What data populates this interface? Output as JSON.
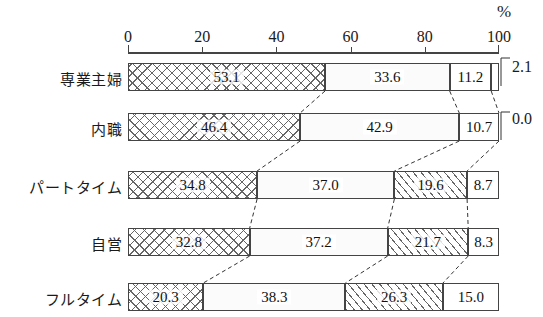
{
  "chart_data": {
    "type": "bar",
    "orientation": "horizontal",
    "stacked": true,
    "stack_mode": "percent",
    "title": "",
    "xlabel": "%",
    "ylabel": "",
    "xlim": [
      0,
      100
    ],
    "xticks": [
      0,
      20,
      40,
      60,
      80,
      100
    ],
    "xtick_labels": [
      "0",
      "20",
      "40",
      "60",
      "80",
      "100"
    ],
    "grid": false,
    "legend": "none",
    "categories": [
      "専業主婦",
      "内職",
      "パートタイム",
      "自営",
      "フルタイム"
    ],
    "series": [
      {
        "name": "series-1",
        "pattern": "cross-hatch",
        "values": [
          53.1,
          46.4,
          34.8,
          32.8,
          20.3
        ]
      },
      {
        "name": "series-2",
        "pattern": "dotted",
        "values": [
          33.6,
          42.9,
          37.0,
          37.2,
          38.3
        ]
      },
      {
        "name": "series-3",
        "pattern": "diagonal-hatch",
        "values": [
          0.0,
          0.0,
          19.6,
          21.7,
          26.3
        ]
      },
      {
        "name": "series-4",
        "pattern": "plain",
        "values": [
          11.2,
          10.7,
          8.7,
          8.3,
          15.0
        ]
      },
      {
        "name": "series-5",
        "pattern": "plain",
        "values": [
          2.1,
          0.0,
          0.0,
          0.0,
          0.0
        ]
      }
    ],
    "annotations": [
      {
        "text": "2.1",
        "row": "専業主婦",
        "position": "right-outside"
      },
      {
        "text": "0.0",
        "row": "内職",
        "position": "right-outside"
      }
    ],
    "rows": [
      {
        "label": "専業主婦",
        "segments": [
          {
            "value": "53.1",
            "size": 53.1,
            "pattern": "cross"
          },
          {
            "value": "33.6",
            "size": 33.6,
            "pattern": "dot"
          },
          {
            "value": "11.2",
            "size": 11.2,
            "pattern": "plain"
          },
          {
            "value": "",
            "size": 2.1,
            "pattern": "plain"
          }
        ]
      },
      {
        "label": "内職",
        "segments": [
          {
            "value": "46.4",
            "size": 46.4,
            "pattern": "cross"
          },
          {
            "value": "42.9",
            "size": 42.9,
            "pattern": "dot"
          },
          {
            "value": "10.7",
            "size": 10.7,
            "pattern": "plain"
          }
        ]
      },
      {
        "label": "パートタイム",
        "segments": [
          {
            "value": "34.8",
            "size": 34.8,
            "pattern": "cross"
          },
          {
            "value": "37.0",
            "size": 37.0,
            "pattern": "dot"
          },
          {
            "value": "19.6",
            "size": 19.6,
            "pattern": "diag"
          },
          {
            "value": "8.7",
            "size": 8.7,
            "pattern": "plain"
          }
        ]
      },
      {
        "label": "自営",
        "segments": [
          {
            "value": "32.8",
            "size": 32.8,
            "pattern": "cross"
          },
          {
            "value": "37.2",
            "size": 37.2,
            "pattern": "dot"
          },
          {
            "value": "21.7",
            "size": 21.7,
            "pattern": "diag"
          },
          {
            "value": "8.3",
            "size": 8.3,
            "pattern": "plain"
          }
        ]
      },
      {
        "label": "フルタイム",
        "segments": [
          {
            "value": "20.3",
            "size": 20.3,
            "pattern": "cross"
          },
          {
            "value": "38.3",
            "size": 38.3,
            "pattern": "dot"
          },
          {
            "value": "26.3",
            "size": 26.3,
            "pattern": "diag"
          },
          {
            "value": "15.0",
            "size": 15.0,
            "pattern": "plain"
          }
        ]
      }
    ]
  },
  "axis": {
    "unit_label": "%",
    "ticks": [
      "0",
      "20",
      "40",
      "60",
      "80",
      "100"
    ]
  },
  "side_annotations": [
    "2.1",
    "0.0"
  ]
}
